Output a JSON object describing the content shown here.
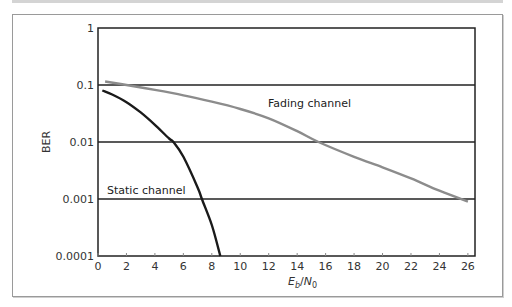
{
  "chart_data": {
    "type": "line",
    "title": "",
    "xlabel": "Eb/N0",
    "ylabel": "BER",
    "xlim": [
      0,
      26.5
    ],
    "ylim": [
      0.0001,
      1
    ],
    "yscale": "log",
    "grid": "horizontal at decades",
    "x_ticks": [
      "0",
      "2",
      "4",
      "6",
      "8",
      "10",
      "12",
      "14",
      "16",
      "18",
      "20",
      "22",
      "24",
      "26"
    ],
    "y_ticks": [
      "1",
      "0.1",
      "0.01",
      "0.001",
      "0.0001"
    ],
    "series": [
      {
        "name": "Fading channel",
        "color": "#8c8c8c",
        "x": [
          0.5,
          2,
          4,
          6,
          8,
          10,
          12,
          14,
          15.5,
          18,
          20,
          22,
          24,
          26
        ],
        "y": [
          0.115,
          0.1,
          0.082,
          0.066,
          0.051,
          0.038,
          0.026,
          0.0155,
          0.01,
          0.0055,
          0.0036,
          0.0023,
          0.0014,
          0.0009
        ]
      },
      {
        "name": "Static channel",
        "color": "#1a1a1a",
        "x": [
          0.3,
          1,
          2,
          3,
          4,
          5,
          5.3,
          6,
          7,
          7.3,
          8,
          8.6
        ],
        "y": [
          0.08,
          0.068,
          0.05,
          0.033,
          0.02,
          0.0115,
          0.01,
          0.0055,
          0.0016,
          0.001,
          0.00035,
          0.0001
        ]
      }
    ],
    "annotations": [
      {
        "text": "Fading channel",
        "x": 11,
        "y": 0.055
      },
      {
        "text": "Static channel",
        "x": 1,
        "y": 0.0013
      }
    ]
  },
  "labels": {
    "ylabel": "BER",
    "xlabel_E": "E",
    "xlabel_b": "b",
    "xlabel_slash": "/",
    "xlabel_N": "N",
    "xlabel_0": "0",
    "fading": "Fading channel",
    "static": "Static channel"
  }
}
